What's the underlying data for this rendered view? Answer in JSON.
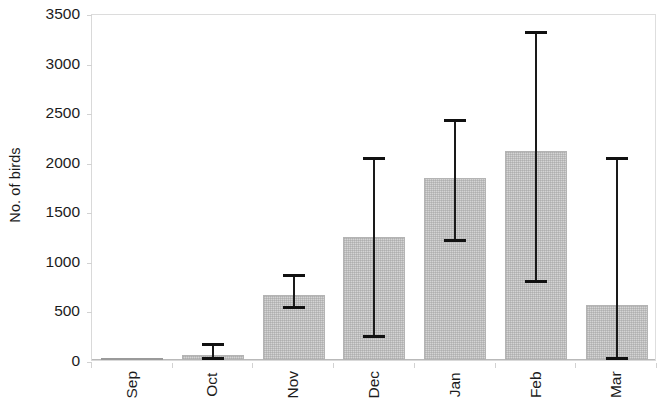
{
  "chart_data": {
    "type": "bar",
    "title": "",
    "xlabel": "",
    "ylabel": "No. of birds",
    "categories": [
      "Sep",
      "Oct",
      "Nov",
      "Dec",
      "Jan",
      "Feb",
      "Mar"
    ],
    "values": [
      5,
      55,
      660,
      1245,
      1835,
      2110,
      550
    ],
    "error_upper": [
      5,
      150,
      845,
      2025,
      2415,
      3300,
      2030
    ],
    "error_lower": [
      5,
      0,
      520,
      235,
      1200,
      785,
      10
    ],
    "ylim": [
      0,
      3500
    ],
    "ytick_labels": [
      "0",
      "500",
      "1000",
      "1500",
      "2000",
      "2500",
      "3000",
      "3500"
    ],
    "ytick_values": [
      0,
      500,
      1000,
      1500,
      2000,
      2500,
      3000,
      3500
    ],
    "grid": false,
    "legend": false,
    "legend_position": "none",
    "series": [
      {
        "name": "No. of birds",
        "values": [
          5,
          55,
          660,
          1245,
          1835,
          2110,
          550
        ]
      }
    ],
    "bar_fill_color": "#d4d4d4",
    "bar_border_color": "#b4b4b4",
    "error_bar_color": "#111111",
    "axis_color": "#d2d2d2"
  }
}
